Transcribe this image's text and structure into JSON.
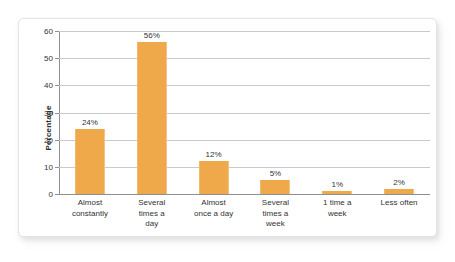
{
  "chart_data": {
    "type": "bar",
    "title": "",
    "xlabel": "",
    "ylabel": "Percentage",
    "categories": [
      "Almost constantly",
      "Several times a day",
      "Almost once a day",
      "Several times a week",
      "1 time a week",
      "Less often"
    ],
    "category_lines": [
      [
        "Almost",
        "constantly"
      ],
      [
        "Several",
        "times a",
        "day"
      ],
      [
        "Almost",
        "once a day"
      ],
      [
        "Several",
        "times a",
        "week"
      ],
      [
        "1 time a",
        "week"
      ],
      [
        "Less often"
      ]
    ],
    "values": [
      24,
      56,
      12,
      5,
      1,
      2
    ],
    "data_labels": [
      "24%",
      "56%",
      "12%",
      "5%",
      "1%",
      "2%"
    ],
    "ylim": [
      0,
      60
    ],
    "yticks": [
      0,
      10,
      20,
      30,
      40,
      50,
      60
    ],
    "ytick_labels": [
      "0",
      "10",
      "20",
      "30",
      "40",
      "50",
      "60"
    ],
    "grid": true,
    "legend": false,
    "bar_color": "#efa94a",
    "gridline_color": "#c9c9cf",
    "axis_color": "#8e8e96",
    "text_color": "#333333"
  }
}
